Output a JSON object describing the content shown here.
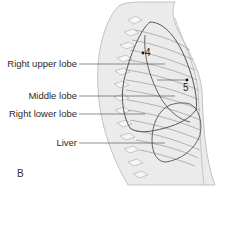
{
  "figure": {
    "panel_label": "B",
    "labels": [
      {
        "id": "right-upper-lobe",
        "text": "Right upper lobe"
      },
      {
        "id": "middle-lobe",
        "text": "Middle lobe"
      },
      {
        "id": "right-lower-lobe",
        "text": "Right lower lobe"
      },
      {
        "id": "liver",
        "text": "Liver"
      }
    ],
    "markers": [
      {
        "id": "marker-4",
        "text": "4"
      },
      {
        "id": "marker-5",
        "text": "5"
      }
    ],
    "colors": {
      "body_fill": "#e6e6e6",
      "outline": "#555555",
      "rib_lines": "#8a8a8a",
      "label_text": "#2a2a2a"
    }
  }
}
